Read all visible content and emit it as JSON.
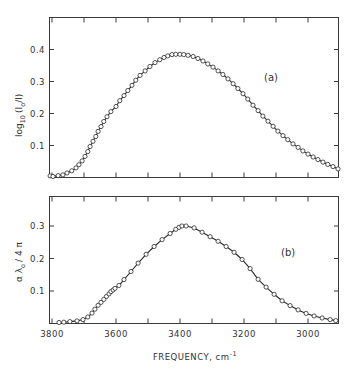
{
  "chart_data": [
    {
      "type": "line",
      "panel": "(a)",
      "ylabel": "log10(I0/I)",
      "xlabel": "FREQUENCY, cm-1",
      "xlim": [
        3800,
        2900
      ],
      "ylim": [
        0,
        0.5
      ],
      "yticks": [
        0.1,
        0.2,
        0.3,
        0.4
      ],
      "xticks": [
        3800,
        3700,
        3600,
        3500,
        3400,
        3300,
        3200,
        3100,
        3000
      ],
      "markers": "open-circle",
      "x": [
        3806,
        3797,
        3781,
        3766,
        3753,
        3738,
        3725,
        3716,
        3706,
        3697,
        3688,
        3681,
        3672,
        3663,
        3656,
        3647,
        3638,
        3628,
        3616,
        3600,
        3588,
        3575,
        3563,
        3550,
        3538,
        3525,
        3509,
        3494,
        3478,
        3463,
        3450,
        3438,
        3425,
        3413,
        3400,
        3388,
        3375,
        3359,
        3344,
        3328,
        3313,
        3297,
        3281,
        3266,
        3250,
        3234,
        3219,
        3203,
        3188,
        3172,
        3156,
        3141,
        3125,
        3109,
        3094,
        3078,
        3063,
        3047,
        3031,
        3016,
        3000,
        2984,
        2969,
        2953,
        2938,
        2922,
        2906
      ],
      "y": [
        0.005,
        0.003,
        0.006,
        0.008,
        0.014,
        0.021,
        0.03,
        0.04,
        0.052,
        0.066,
        0.081,
        0.097,
        0.113,
        0.128,
        0.144,
        0.159,
        0.175,
        0.19,
        0.206,
        0.222,
        0.24,
        0.256,
        0.272,
        0.288,
        0.304,
        0.319,
        0.333,
        0.347,
        0.359,
        0.368,
        0.375,
        0.38,
        0.384,
        0.385,
        0.385,
        0.384,
        0.382,
        0.378,
        0.372,
        0.364,
        0.355,
        0.345,
        0.333,
        0.322,
        0.308,
        0.293,
        0.278,
        0.262,
        0.245,
        0.226,
        0.209,
        0.192,
        0.176,
        0.16,
        0.145,
        0.131,
        0.118,
        0.105,
        0.094,
        0.083,
        0.073,
        0.064,
        0.056,
        0.048,
        0.041,
        0.034,
        0.027
      ]
    },
    {
      "type": "line",
      "panel": "(b)",
      "ylabel": "αλ0/4π",
      "xlabel": "FREQUENCY, cm-1",
      "xlim": [
        3800,
        2900
      ],
      "ylim": [
        0,
        0.39
      ],
      "yticks": [
        0.1,
        0.2,
        0.3
      ],
      "xticks": [
        3800,
        3700,
        3600,
        3500,
        3400,
        3300,
        3200,
        3100,
        3000
      ],
      "markers": "open-circle",
      "x": [
        3778,
        3763,
        3744,
        3722,
        3703,
        3688,
        3675,
        3666,
        3656,
        3647,
        3638,
        3630,
        3622,
        3616,
        3609,
        3603,
        3591,
        3575,
        3553,
        3531,
        3506,
        3481,
        3456,
        3431,
        3413,
        3403,
        3394,
        3381,
        3356,
        3331,
        3306,
        3281,
        3256,
        3231,
        3206,
        3181,
        3156,
        3131,
        3106,
        3081,
        3056,
        3031,
        3006,
        2981,
        2956,
        2931,
        2913
      ],
      "y": [
        0.003,
        0.004,
        0.006,
        0.008,
        0.012,
        0.02,
        0.032,
        0.044,
        0.056,
        0.065,
        0.074,
        0.083,
        0.091,
        0.098,
        0.103,
        0.108,
        0.117,
        0.135,
        0.16,
        0.186,
        0.213,
        0.237,
        0.258,
        0.277,
        0.29,
        0.296,
        0.3,
        0.3,
        0.294,
        0.281,
        0.267,
        0.253,
        0.237,
        0.219,
        0.197,
        0.169,
        0.136,
        0.112,
        0.09,
        0.07,
        0.055,
        0.042,
        0.031,
        0.023,
        0.017,
        0.012,
        0.009
      ]
    }
  ],
  "panels": {
    "a": {
      "tag": "(a)",
      "ylabel_main": "log",
      "ylabel_sub": "10",
      "ylabel_rest": "(I",
      "ylabel_sub2": "o",
      "ylabel_tail": "/I)",
      "yticklabels": [
        "0.1",
        "0.2",
        "0.3",
        "0.4"
      ]
    },
    "b": {
      "tag": "(b)",
      "ylabel_main": "α λ",
      "ylabel_sub": "o",
      "ylabel_tail": "/ 4 π",
      "yticklabels": [
        "0.1",
        "0.2",
        "0.3"
      ]
    }
  },
  "xaxis": {
    "ticklabels": [
      "3800",
      "3600",
      "3400",
      "3200",
      "3000"
    ],
    "label": "FREQUENCY, cm",
    "label_sup": "-1"
  }
}
